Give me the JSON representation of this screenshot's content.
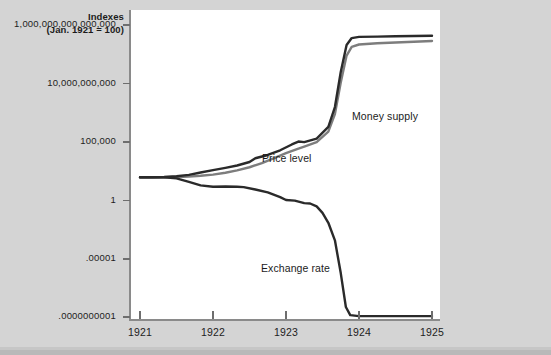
{
  "figure": {
    "background_color": "#d4d4d4",
    "plot_background_color": "#ffffff",
    "frame_color": "#8a8a8a"
  },
  "axis_title": {
    "line1": "Indexes",
    "line2": "(Jan. 1921 = 100)"
  },
  "chart_data": {
    "type": "line",
    "title": "Indexes (Jan. 1921 = 100)",
    "subtitle": "",
    "xlabel": "",
    "ylabel": "Indexes (Jan. 1921 = 100)",
    "y_scale": "log",
    "grid": false,
    "legend_position": "inline-annotations",
    "xlim": [
      1921.0,
      1925.0
    ],
    "x_ticks": [
      1921,
      1922,
      1923,
      1924,
      1925
    ],
    "x_tick_labels": [
      "1921",
      "1922",
      "1923",
      "1924",
      "1925"
    ],
    "ylim_exponent": [
      -10.3,
      16.3
    ],
    "y_ticks_exponent": [
      15,
      10,
      5,
      0,
      -5,
      -10
    ],
    "y_tick_labels": [
      "1,000,000,000,000,000",
      "10,000,000,000",
      "100,000",
      "1",
      ".00001",
      ".0000000001"
    ],
    "series": [
      {
        "name": "Money supply",
        "color": "#7d7d7d",
        "label_text": "Money supply",
        "points_log10": [
          [
            1921.0,
            2.0
          ],
          [
            1921.17,
            2.0
          ],
          [
            1921.33,
            2.0
          ],
          [
            1921.5,
            2.02
          ],
          [
            1921.67,
            2.05
          ],
          [
            1921.83,
            2.12
          ],
          [
            1922.0,
            2.22
          ],
          [
            1922.17,
            2.38
          ],
          [
            1922.33,
            2.58
          ],
          [
            1922.5,
            2.85
          ],
          [
            1922.67,
            3.2
          ],
          [
            1922.83,
            3.6
          ],
          [
            1923.0,
            4.05
          ],
          [
            1923.17,
            4.45
          ],
          [
            1923.25,
            4.62
          ],
          [
            1923.42,
            5.0
          ],
          [
            1923.58,
            5.9
          ],
          [
            1923.67,
            7.4
          ],
          [
            1923.75,
            10.1
          ],
          [
            1923.83,
            12.4
          ],
          [
            1923.9,
            13.15
          ],
          [
            1924.0,
            13.35
          ],
          [
            1924.25,
            13.45
          ],
          [
            1924.5,
            13.52
          ],
          [
            1924.75,
            13.58
          ],
          [
            1925.0,
            13.65
          ]
        ]
      },
      {
        "name": "Price level",
        "color": "#2a2a2a",
        "label_text": "Price level",
        "points_log10": [
          [
            1921.0,
            2.0
          ],
          [
            1921.17,
            2.0
          ],
          [
            1921.33,
            2.02
          ],
          [
            1921.5,
            2.08
          ],
          [
            1921.67,
            2.2
          ],
          [
            1921.83,
            2.4
          ],
          [
            1922.0,
            2.6
          ],
          [
            1922.17,
            2.8
          ],
          [
            1922.33,
            3.0
          ],
          [
            1922.5,
            3.3
          ],
          [
            1922.58,
            3.62
          ],
          [
            1922.75,
            3.9
          ],
          [
            1922.92,
            4.3
          ],
          [
            1923.08,
            4.8
          ],
          [
            1923.17,
            5.05
          ],
          [
            1923.25,
            5.0
          ],
          [
            1923.42,
            5.3
          ],
          [
            1923.58,
            6.3
          ],
          [
            1923.67,
            8.0
          ],
          [
            1923.75,
            11.0
          ],
          [
            1923.83,
            13.3
          ],
          [
            1923.9,
            13.9
          ],
          [
            1924.0,
            14.0
          ],
          [
            1924.25,
            14.02
          ],
          [
            1924.5,
            14.05
          ],
          [
            1924.75,
            14.08
          ],
          [
            1925.0,
            14.1
          ]
        ]
      },
      {
        "name": "Exchange rate",
        "color": "#2a2a2a",
        "label_text": "Exchange rate",
        "points_log10": [
          [
            1921.0,
            2.0
          ],
          [
            1921.17,
            2.0
          ],
          [
            1921.33,
            2.0
          ],
          [
            1921.5,
            1.9
          ],
          [
            1921.67,
            1.6
          ],
          [
            1921.83,
            1.3
          ],
          [
            1922.0,
            1.18
          ],
          [
            1922.17,
            1.2
          ],
          [
            1922.33,
            1.18
          ],
          [
            1922.42,
            1.15
          ],
          [
            1922.58,
            0.95
          ],
          [
            1922.75,
            0.7
          ],
          [
            1922.92,
            0.3
          ],
          [
            1923.0,
            0.05
          ],
          [
            1923.12,
            0.0
          ],
          [
            1923.25,
            -0.22
          ],
          [
            1923.33,
            -0.25
          ],
          [
            1923.42,
            -0.5
          ],
          [
            1923.5,
            -1.05
          ],
          [
            1923.58,
            -1.9
          ],
          [
            1923.67,
            -3.4
          ],
          [
            1923.75,
            -6.2
          ],
          [
            1923.82,
            -9.1
          ],
          [
            1923.88,
            -9.8
          ],
          [
            1924.0,
            -9.88
          ],
          [
            1924.25,
            -9.88
          ],
          [
            1924.5,
            -9.88
          ],
          [
            1924.75,
            -9.88
          ],
          [
            1925.0,
            -9.88
          ]
        ]
      }
    ],
    "annotations": [
      {
        "text": "Money supply",
        "x_px": 352,
        "y_px": 110
      },
      {
        "text": "Price level",
        "x_px": 262,
        "y_px": 152
      },
      {
        "text": "Exchange rate",
        "x_px": 261,
        "y_px": 262
      }
    ]
  }
}
